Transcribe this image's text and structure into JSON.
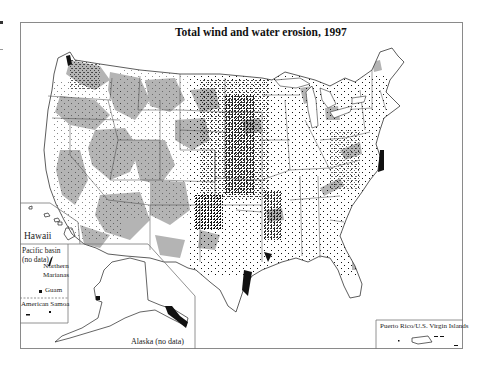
{
  "map": {
    "title": "Total wind and water erosion, 1997",
    "insets": {
      "hawaii": "Hawaii",
      "pacific_basin": "Pacific basin (no data)",
      "northern_marianas": "Northern Marianas",
      "guam": "Guam",
      "american_samoa": "American Samoa",
      "alaska": "Alaska (no data)",
      "puerto_rico": "Puerto Rico/U.S. Virgin Islands"
    },
    "colors": {
      "erosion_area": "#b4b4b4",
      "dots": "#111111",
      "borders": "#333333",
      "frame": "#8a8a8a",
      "background": "#ffffff"
    },
    "legend_symbols": {
      "gray_fill": "erosion-area",
      "black_dots": "erosion-points"
    }
  }
}
